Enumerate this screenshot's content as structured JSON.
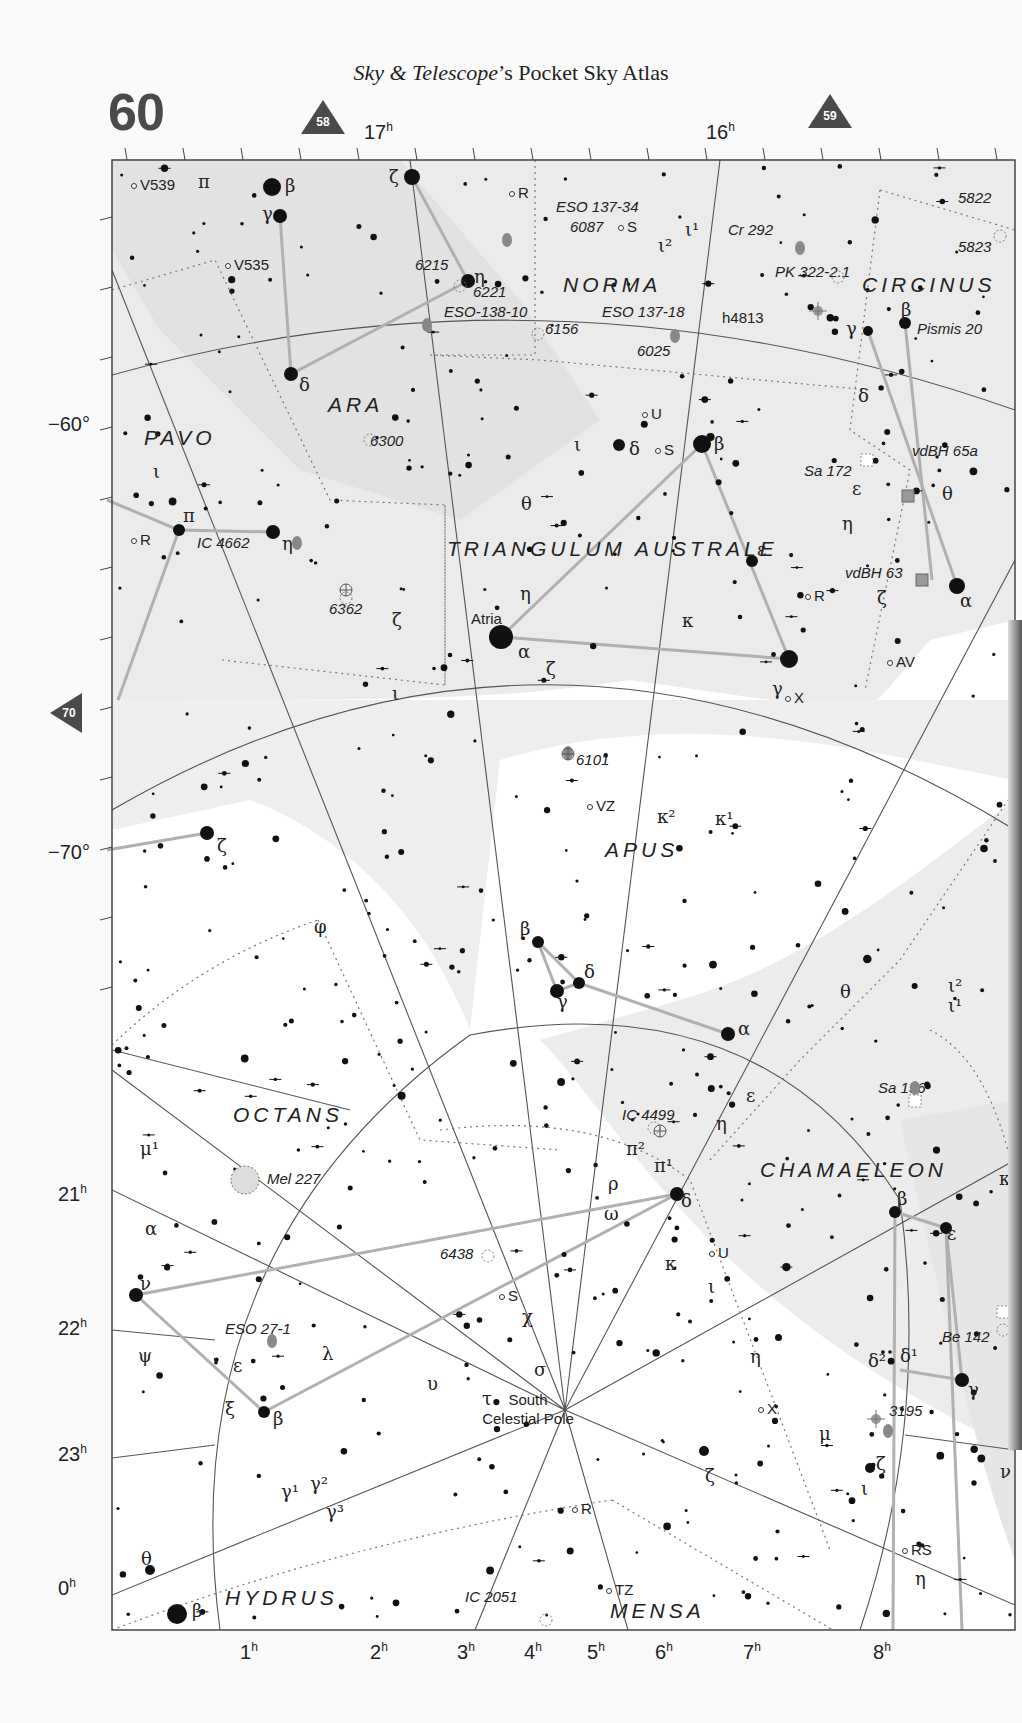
{
  "header": {
    "title_italic": "Sky & Telescope",
    "title_rest": "’s Pocket Sky Atlas",
    "page_number": "60"
  },
  "navigation": {
    "adjacent_top_left": "58",
    "adjacent_top_right": "59",
    "adjacent_left": "70"
  },
  "axes": {
    "ra_top": [
      {
        "label": "17",
        "x": 378
      },
      {
        "label": "16",
        "x": 720
      }
    ],
    "ra_bottom": [
      {
        "label": "1",
        "x": 250
      },
      {
        "label": "2",
        "x": 380
      },
      {
        "label": "3",
        "x": 467
      },
      {
        "label": "4",
        "x": 534
      },
      {
        "label": "5",
        "x": 597
      },
      {
        "label": "6",
        "x": 665
      },
      {
        "label": "7",
        "x": 753
      },
      {
        "label": "8",
        "x": 883
      }
    ],
    "ra_left": [
      {
        "label": "21",
        "y": 1196
      },
      {
        "label": "22",
        "y": 1330
      },
      {
        "label": "23",
        "y": 1456
      },
      {
        "label": "0",
        "y": 1590
      }
    ],
    "dec_left": [
      {
        "label": "−60°",
        "y": 427
      },
      {
        "label": "−70°",
        "y": 855
      }
    ],
    "unit_hour": "h"
  },
  "colors": {
    "milky_way": "#e9e9e9",
    "background": "#ffffff",
    "frame": "#444444",
    "grid": "#555555",
    "stick_figure": "#b0b0b0",
    "boundary": "#777777",
    "deep_sky": "#888888",
    "nav_marker": "#4a4a4a"
  },
  "constellations": [
    {
      "name": "NORMA",
      "x": 563,
      "y": 292
    },
    {
      "name": "CIRCINUS",
      "x": 862,
      "y": 292
    },
    {
      "name": "ARA",
      "x": 328,
      "y": 412
    },
    {
      "name": "PAVO",
      "x": 144,
      "y": 445
    },
    {
      "name": "TRIANGULUM AUSTRALE",
      "x": 447,
      "y": 556
    },
    {
      "name": "APUS",
      "x": 605,
      "y": 857
    },
    {
      "name": "OCTANS",
      "x": 233,
      "y": 1122
    },
    {
      "name": "CHAMAELEON",
      "x": 760,
      "y": 1177
    },
    {
      "name": "HYDRUS",
      "x": 225,
      "y": 1605
    },
    {
      "name": "MENSA",
      "x": 610,
      "y": 1618
    }
  ],
  "deep_sky_objects": [
    {
      "label": "ESO 137-34",
      "x": 556,
      "y": 212
    },
    {
      "label": "6087",
      "x": 570,
      "y": 232
    },
    {
      "label": "Cr 292",
      "x": 728,
      "y": 235
    },
    {
      "label": "5822",
      "x": 958,
      "y": 203
    },
    {
      "label": "5823",
      "x": 958,
      "y": 252
    },
    {
      "label": "PK 322-2.1",
      "x": 775,
      "y": 277
    },
    {
      "label": "6215",
      "x": 415,
      "y": 270
    },
    {
      "label": "6221",
      "x": 473,
      "y": 297
    },
    {
      "label": "ESO-138-10",
      "x": 444,
      "y": 317
    },
    {
      "label": "ESO 137-18",
      "x": 602,
      "y": 317
    },
    {
      "label": "6156",
      "x": 545,
      "y": 334
    },
    {
      "label": "6025",
      "x": 637,
      "y": 356
    },
    {
      "label": "Pismis 20",
      "x": 917,
      "y": 334
    },
    {
      "label": "6300",
      "x": 370,
      "y": 446
    },
    {
      "label": "Sa 172",
      "x": 804,
      "y": 476
    },
    {
      "label": "vdBH 65a",
      "x": 912,
      "y": 456
    },
    {
      "label": "IC 4662",
      "x": 197,
      "y": 548
    },
    {
      "label": "vdBH 63",
      "x": 845,
      "y": 578
    },
    {
      "label": "6362",
      "x": 329,
      "y": 614
    },
    {
      "label": "6101",
      "x": 576,
      "y": 765
    },
    {
      "label": "Sa 156",
      "x": 878,
      "y": 1093
    },
    {
      "label": "IC 4499",
      "x": 622,
      "y": 1120
    },
    {
      "label": "Mel 227",
      "x": 267,
      "y": 1184
    },
    {
      "label": "6438",
      "x": 440,
      "y": 1259
    },
    {
      "label": "ESO 27-1",
      "x": 225,
      "y": 1334
    },
    {
      "label": "Be 142",
      "x": 942,
      "y": 1342
    },
    {
      "label": "3195",
      "x": 889,
      "y": 1416
    },
    {
      "label": "IC 2051",
      "x": 465,
      "y": 1602
    }
  ],
  "named_stars": [
    {
      "label": "Atria",
      "x": 471,
      "y": 624
    },
    {
      "label": "h4813",
      "x": 722,
      "y": 323
    }
  ],
  "variable_stars": [
    {
      "label": "V539",
      "x": 140,
      "y": 190
    },
    {
      "label": "V535",
      "x": 234,
      "y": 270
    },
    {
      "label": "R",
      "x": 518,
      "y": 198
    },
    {
      "label": "S",
      "x": 627,
      "y": 232
    },
    {
      "label": "U",
      "x": 651,
      "y": 419
    },
    {
      "label": "S",
      "x": 664,
      "y": 455
    },
    {
      "label": "R",
      "x": 140,
      "y": 545
    },
    {
      "label": "R",
      "x": 814,
      "y": 601
    },
    {
      "label": "AV",
      "x": 896,
      "y": 667
    },
    {
      "label": "X",
      "x": 794,
      "y": 703
    },
    {
      "label": "VZ",
      "x": 596,
      "y": 811
    },
    {
      "label": "U",
      "x": 718,
      "y": 1258
    },
    {
      "label": "S",
      "x": 508,
      "y": 1301
    },
    {
      "label": "X",
      "x": 767,
      "y": 1414
    },
    {
      "label": "R",
      "x": 581,
      "y": 1514
    },
    {
      "label": "TZ",
      "x": 615,
      "y": 1595
    },
    {
      "label": "RS",
      "x": 911,
      "y": 1555
    }
  ],
  "special_labels": [
    {
      "label": "South",
      "x": 528,
      "y": 1405
    },
    {
      "label": "Celestial Pole",
      "x": 528,
      "y": 1424
    }
  ],
  "greek_labels": [
    {
      "t": "π",
      "x": 198,
      "y": 188
    },
    {
      "t": "β",
      "x": 285,
      "y": 192
    },
    {
      "t": "γ",
      "x": 262,
      "y": 220
    },
    {
      "t": "ζ",
      "x": 389,
      "y": 183
    },
    {
      "t": "η",
      "x": 474,
      "y": 283
    },
    {
      "t": "ι¹",
      "x": 685,
      "y": 236
    },
    {
      "t": "ι²",
      "x": 658,
      "y": 252
    },
    {
      "t": "δ",
      "x": 299,
      "y": 391
    },
    {
      "t": "β",
      "x": 901,
      "y": 316
    },
    {
      "t": "γ",
      "x": 846,
      "y": 335
    },
    {
      "t": "δ",
      "x": 858,
      "y": 402
    },
    {
      "t": "ι",
      "x": 574,
      "y": 451
    },
    {
      "t": "δ",
      "x": 629,
      "y": 455
    },
    {
      "t": "β",
      "x": 714,
      "y": 450
    },
    {
      "t": "ι",
      "x": 153,
      "y": 478
    },
    {
      "t": "θ",
      "x": 521,
      "y": 510
    },
    {
      "t": "ε",
      "x": 852,
      "y": 495
    },
    {
      "t": "θ",
      "x": 942,
      "y": 500
    },
    {
      "t": "π",
      "x": 183,
      "y": 522
    },
    {
      "t": "η",
      "x": 282,
      "y": 550
    },
    {
      "t": "η",
      "x": 842,
      "y": 530
    },
    {
      "t": "ε",
      "x": 757,
      "y": 556
    },
    {
      "t": "η",
      "x": 520,
      "y": 600
    },
    {
      "t": "ζ",
      "x": 392,
      "y": 626
    },
    {
      "t": "κ",
      "x": 682,
      "y": 627
    },
    {
      "t": "ζ",
      "x": 877,
      "y": 604
    },
    {
      "t": "α",
      "x": 518,
      "y": 658
    },
    {
      "t": "ζ",
      "x": 546,
      "y": 675
    },
    {
      "t": "γ",
      "x": 772,
      "y": 695
    },
    {
      "t": "α",
      "x": 960,
      "y": 607
    },
    {
      "t": "ι",
      "x": 392,
      "y": 700
    },
    {
      "t": "κ²",
      "x": 657,
      "y": 823
    },
    {
      "t": "κ¹",
      "x": 715,
      "y": 825
    },
    {
      "t": "ζ",
      "x": 217,
      "y": 852
    },
    {
      "t": "φ",
      "x": 314,
      "y": 933
    },
    {
      "t": "β",
      "x": 520,
      "y": 935
    },
    {
      "t": "δ",
      "x": 584,
      "y": 978
    },
    {
      "t": "γ",
      "x": 557,
      "y": 1008
    },
    {
      "t": "θ",
      "x": 840,
      "y": 998
    },
    {
      "t": "ι²",
      "x": 948,
      "y": 992
    },
    {
      "t": "ι¹",
      "x": 948,
      "y": 1012
    },
    {
      "t": "α",
      "x": 738,
      "y": 1035
    },
    {
      "t": "ε",
      "x": 746,
      "y": 1102
    },
    {
      "t": "η",
      "x": 716,
      "y": 1130
    },
    {
      "t": "μ¹",
      "x": 140,
      "y": 1155
    },
    {
      "t": "π²",
      "x": 626,
      "y": 1155
    },
    {
      "t": "π¹",
      "x": 654,
      "y": 1172
    },
    {
      "t": "ρ",
      "x": 608,
      "y": 1190
    },
    {
      "t": "δ",
      "x": 681,
      "y": 1207
    },
    {
      "t": "κ",
      "x": 999,
      "y": 1185
    },
    {
      "t": "β",
      "x": 897,
      "y": 1205
    },
    {
      "t": "α",
      "x": 145,
      "y": 1235
    },
    {
      "t": "ω",
      "x": 604,
      "y": 1220
    },
    {
      "t": "ε",
      "x": 947,
      "y": 1240
    },
    {
      "t": "κ",
      "x": 665,
      "y": 1270
    },
    {
      "t": "ν",
      "x": 140,
      "y": 1290
    },
    {
      "t": "ι",
      "x": 708,
      "y": 1293
    },
    {
      "t": "χ",
      "x": 522,
      "y": 1323
    },
    {
      "t": "λ",
      "x": 322,
      "y": 1360
    },
    {
      "t": "η",
      "x": 750,
      "y": 1363
    },
    {
      "t": "ψ",
      "x": 138,
      "y": 1362
    },
    {
      "t": "ε",
      "x": 233,
      "y": 1372
    },
    {
      "t": "δ²",
      "x": 868,
      "y": 1367
    },
    {
      "t": "δ¹",
      "x": 900,
      "y": 1362
    },
    {
      "t": "σ",
      "x": 534,
      "y": 1376
    },
    {
      "t": "γ",
      "x": 968,
      "y": 1396
    },
    {
      "t": "υ",
      "x": 427,
      "y": 1390
    },
    {
      "t": "τ",
      "x": 482,
      "y": 1405
    },
    {
      "t": "ξ",
      "x": 225,
      "y": 1415
    },
    {
      "t": "β",
      "x": 273,
      "y": 1425
    },
    {
      "t": "μ",
      "x": 819,
      "y": 1440
    },
    {
      "t": "ζ",
      "x": 876,
      "y": 1470
    },
    {
      "t": "ν",
      "x": 1000,
      "y": 1478
    },
    {
      "t": "ζ",
      "x": 705,
      "y": 1482
    },
    {
      "t": "ι",
      "x": 861,
      "y": 1495
    },
    {
      "t": "γ¹",
      "x": 281,
      "y": 1498
    },
    {
      "t": "γ²",
      "x": 310,
      "y": 1490
    },
    {
      "t": "γ³",
      "x": 326,
      "y": 1518
    },
    {
      "t": "η",
      "x": 915,
      "y": 1585
    },
    {
      "t": "θ",
      "x": 141,
      "y": 1565
    },
    {
      "t": "β",
      "x": 192,
      "y": 1617
    }
  ],
  "bright_stars": [
    {
      "x": 272,
      "y": 187,
      "r": 9
    },
    {
      "x": 280,
      "y": 216,
      "r": 7
    },
    {
      "x": 412,
      "y": 177,
      "r": 8
    },
    {
      "x": 468,
      "y": 281,
      "r": 7
    },
    {
      "x": 291,
      "y": 374,
      "r": 7
    },
    {
      "x": 702,
      "y": 444,
      "r": 9
    },
    {
      "x": 619,
      "y": 445,
      "r": 6
    },
    {
      "x": 905,
      "y": 323,
      "r": 6
    },
    {
      "x": 868,
      "y": 331,
      "r": 5
    },
    {
      "x": 273,
      "y": 532,
      "r": 7
    },
    {
      "x": 179,
      "y": 530,
      "r": 6
    },
    {
      "x": 501,
      "y": 637,
      "r": 12
    },
    {
      "x": 789,
      "y": 659,
      "r": 9
    },
    {
      "x": 752,
      "y": 561,
      "r": 6
    },
    {
      "x": 957,
      "y": 586,
      "r": 8
    },
    {
      "x": 207,
      "y": 833,
      "r": 7
    },
    {
      "x": 538,
      "y": 942,
      "r": 6
    },
    {
      "x": 557,
      "y": 991,
      "r": 7
    },
    {
      "x": 579,
      "y": 983,
      "r": 6
    },
    {
      "x": 728,
      "y": 1034,
      "r": 7
    },
    {
      "x": 677,
      "y": 1194,
      "r": 7
    },
    {
      "x": 895,
      "y": 1212,
      "r": 6
    },
    {
      "x": 946,
      "y": 1228,
      "r": 6
    },
    {
      "x": 136,
      "y": 1295,
      "r": 7
    },
    {
      "x": 264,
      "y": 1412,
      "r": 6
    },
    {
      "x": 962,
      "y": 1380,
      "r": 7
    },
    {
      "x": 177,
      "y": 1614,
      "r": 10
    },
    {
      "x": 150,
      "y": 1570,
      "r": 5
    },
    {
      "x": 704,
      "y": 1451,
      "r": 5
    },
    {
      "x": 870,
      "y": 1468,
      "r": 5
    }
  ],
  "stick_figures": [
    [
      [
        280,
        216
      ],
      [
        291,
        374
      ],
      [
        468,
        281
      ]
    ],
    [
      [
        412,
        177
      ],
      [
        468,
        281
      ]
    ],
    [
      [
        179,
        530
      ],
      [
        273,
        532
      ]
    ],
    [
      [
        107,
        500
      ],
      [
        179,
        530
      ],
      [
        118,
        700
      ]
    ],
    [
      [
        501,
        637
      ],
      [
        702,
        444
      ],
      [
        789,
        659
      ],
      [
        501,
        637
      ]
    ],
    [
      [
        868,
        331
      ],
      [
        957,
        586
      ]
    ],
    [
      [
        905,
        323
      ],
      [
        932,
        580
      ]
    ],
    [
      [
        107,
        850
      ],
      [
        207,
        833
      ]
    ],
    [
      [
        538,
        942
      ],
      [
        557,
        991
      ],
      [
        579,
        983
      ],
      [
        538,
        942
      ]
    ],
    [
      [
        579,
        983
      ],
      [
        728,
        1034
      ]
    ],
    [
      [
        136,
        1295
      ],
      [
        677,
        1194
      ]
    ],
    [
      [
        136,
        1295
      ],
      [
        264,
        1412
      ],
      [
        677,
        1194
      ]
    ],
    [
      [
        895,
        1212
      ],
      [
        946,
        1228
      ],
      [
        962,
        1380
      ],
      [
        900,
        1370
      ]
    ],
    [
      [
        895,
        1212
      ],
      [
        893,
        1630
      ]
    ],
    [
      [
        946,
        1228
      ],
      [
        962,
        1630
      ]
    ]
  ]
}
